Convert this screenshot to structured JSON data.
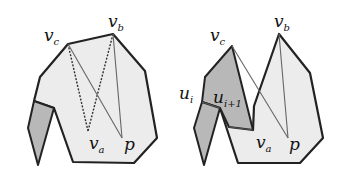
{
  "figure": {
    "left_panel": {
      "labels": {
        "vc": "v",
        "vc_sub": "c",
        "vb": "v",
        "vb_sub": "b",
        "va": "v",
        "va_sub": "a",
        "p": "p"
      }
    },
    "right_panel": {
      "labels": {
        "vc": "v",
        "vc_sub": "c",
        "vb": "v",
        "vb_sub": "b",
        "va": "v",
        "va_sub": "a",
        "p": "p",
        "ui": "u",
        "ui_sub": "i",
        "ui1": "u",
        "ui1_sub": "i+1"
      }
    },
    "colors": {
      "light_fill": "#ececec",
      "dark_fill": "#b8b8b8",
      "edge": "#222222",
      "thin_line": "#666666"
    }
  }
}
